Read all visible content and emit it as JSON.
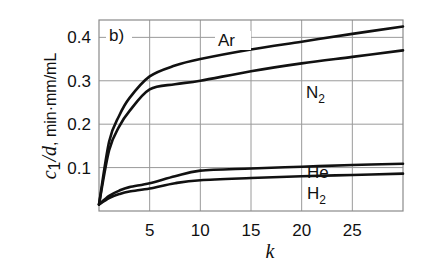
{
  "chart_data": {
    "type": "line",
    "panel_label": "b)",
    "title": "",
    "xlabel": "k",
    "ylabel": "c1/d, min·mm/mL",
    "xlim": [
      0,
      30
    ],
    "ylim": [
      0,
      0.44
    ],
    "grid": true,
    "x_ticks": [
      5,
      10,
      15,
      20,
      25
    ],
    "y_ticks": [
      0.1,
      0.2,
      0.3,
      0.4
    ],
    "x_tick_labels": [
      "5",
      "10",
      "15",
      "20",
      "25"
    ],
    "y_tick_labels": [
      "0.1",
      "0.2",
      "0.3",
      "0.4"
    ],
    "legend_position": "inline labels",
    "x": [
      0,
      1,
      2,
      3,
      5,
      7.5,
      10,
      15,
      20,
      25,
      30
    ],
    "series": [
      {
        "name": "Ar",
        "label": "Ar",
        "label_sub": "",
        "values": [
          0.015,
          0.16,
          0.22,
          0.26,
          0.31,
          0.335,
          0.35,
          0.372,
          0.39,
          0.408,
          0.425
        ]
      },
      {
        "name": "N2",
        "label": "N",
        "label_sub": "2",
        "values": [
          0.015,
          0.14,
          0.195,
          0.23,
          0.28,
          0.292,
          0.3,
          0.322,
          0.34,
          0.355,
          0.37
        ]
      },
      {
        "name": "He",
        "label": "He",
        "label_sub": "",
        "values": [
          0.015,
          0.035,
          0.047,
          0.055,
          0.064,
          0.08,
          0.093,
          0.098,
          0.102,
          0.106,
          0.109
        ]
      },
      {
        "name": "H2",
        "label": "H",
        "label_sub": "2",
        "values": [
          0.015,
          0.03,
          0.039,
          0.045,
          0.052,
          0.064,
          0.071,
          0.076,
          0.08,
          0.083,
          0.086
        ]
      }
    ]
  },
  "axis": {
    "ylabel_var": "c",
    "ylabel_sub": "1",
    "ylabel_slash_var": "/d",
    "ylabel_units": ", min·mm/mL",
    "xlabel": "k"
  }
}
